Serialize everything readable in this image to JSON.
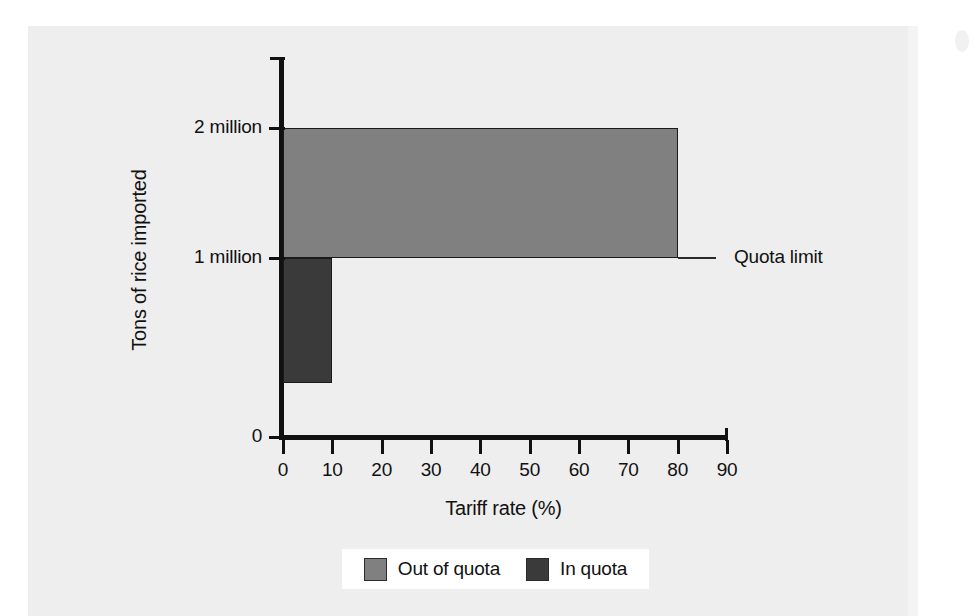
{
  "chart_data": {
    "type": "bar",
    "orientation": "horizontal-step",
    "title": "",
    "xlabel": "Tariff rate (%)",
    "ylabel": "Tons of rice imported",
    "xlim": [
      0,
      90
    ],
    "ylim": [
      0,
      2300000
    ],
    "grid": false,
    "x_ticks": [
      {
        "value": 0,
        "label": "0"
      },
      {
        "value": 10,
        "label": "10"
      },
      {
        "value": 20,
        "label": "20"
      },
      {
        "value": 30,
        "label": "30"
      },
      {
        "value": 40,
        "label": "40"
      },
      {
        "value": 50,
        "label": "50"
      },
      {
        "value": 60,
        "label": "60"
      },
      {
        "value": 70,
        "label": "70"
      },
      {
        "value": 80,
        "label": "80"
      },
      {
        "value": 90,
        "label": "90"
      }
    ],
    "y_ticks": [
      {
        "value": 0,
        "label": "0"
      },
      {
        "value": 1000000,
        "label": "1 million"
      },
      {
        "value": 2000000,
        "label": "2 million"
      }
    ],
    "series": [
      {
        "name": "In quota",
        "color": "#3a3a3a",
        "tariff_from": 0,
        "tariff_to": 10,
        "tons_from": 300000,
        "tons_to": 1000000
      },
      {
        "name": "Out of quota",
        "color": "#808080",
        "tariff_from": 0,
        "tariff_to": 80,
        "tons_from": 1000000,
        "tons_to": 2000000
      }
    ],
    "annotations": [
      {
        "name": "quota-limit",
        "label": "Quota limit",
        "at_tons": 1000000
      }
    ],
    "legend": {
      "position": "bottom",
      "entries": [
        {
          "label": "Out of quota",
          "color": "#808080"
        },
        {
          "label": "In quota",
          "color": "#3a3a3a"
        }
      ]
    }
  },
  "colors": {
    "out_of_quota": "#808080",
    "in_quota": "#3a3a3a",
    "axis": "#111111",
    "page": "#eeeeee"
  }
}
